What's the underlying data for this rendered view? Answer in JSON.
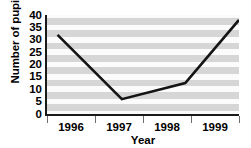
{
  "chart_data": {
    "type": "line",
    "title": "",
    "xlabel": "Year",
    "ylabel": "Number of pupils",
    "categories": [
      "1996",
      "1997",
      "1998",
      "1999"
    ],
    "values": [
      32,
      6,
      12.5,
      38
    ],
    "series": [
      {
        "name": "Number of pupils",
        "values": [
          32,
          6,
          12.5,
          38
        ]
      }
    ],
    "ylim": [
      0,
      40
    ],
    "ytick_labels": [
      "0",
      "5",
      "10",
      "15",
      "20",
      "25",
      "30",
      "35",
      "40"
    ],
    "ytick_values": [
      0,
      5,
      10,
      15,
      20,
      25,
      30,
      35,
      40
    ],
    "grid": "horizontal-alternating-bands",
    "legend": "none",
    "markers": "none",
    "line_color": "#141414",
    "band_color": "#d6d6d6",
    "band_alt_color": "#fbfbfb",
    "annotations": []
  }
}
